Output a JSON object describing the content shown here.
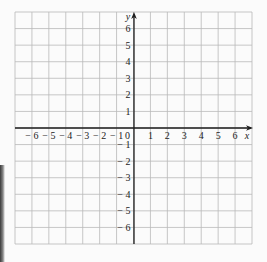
{
  "chart_data": {
    "type": "coordinate-grid",
    "title": "",
    "xlabel": "x",
    "ylabel": "y",
    "xlim": [
      -7,
      7
    ],
    "ylim": [
      -7,
      7
    ],
    "grid": true,
    "x_ticks": [
      "-6",
      "-5",
      "-4",
      "-3",
      "-2",
      "-1",
      "0",
      "1",
      "2",
      "3",
      "4",
      "5",
      "6"
    ],
    "y_ticks": [
      "6",
      "5",
      "4",
      "3",
      "2",
      "1",
      "-1",
      "-2",
      "-3",
      "-4",
      "-5",
      "-6"
    ],
    "series": []
  },
  "labels": {
    "x_axis": "x",
    "y_axis": "y",
    "origin": "0"
  },
  "colors": {
    "grid": "#b9b9b9",
    "axis": "#1e1e1e",
    "text": "#222222",
    "background": "#fbfbfb"
  }
}
